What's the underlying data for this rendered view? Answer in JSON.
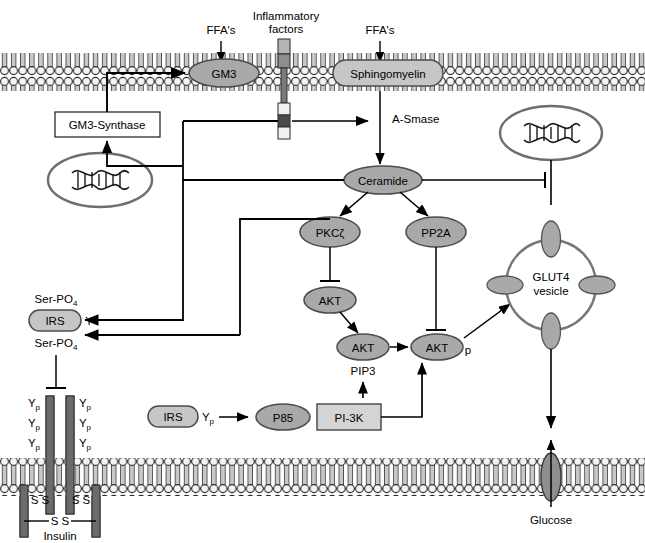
{
  "diagram": {
    "colors": {
      "node_fill": "#a9a9a9",
      "node_stroke": "#4d4d4d",
      "box_fill": "#ffffff",
      "pi3k_fill": "#d4d4d4",
      "membrane_tail": "#c8c8c8",
      "membrane_head": "#f2f2f2",
      "membrane_outline": "#333333",
      "receptor_dark": "#5a5a5a",
      "receptor_light": "#b5b5b5",
      "line": "#000000",
      "nucleus_stroke": "#666666"
    }
  },
  "stimuli": {
    "ffa_left": "FFA's",
    "inflammatory": {
      "line1": "Inflammatory",
      "line2": "factors"
    },
    "ffa_right": "FFA's"
  },
  "membrane_top": {
    "gm3": "GM3",
    "sphingomyelin": "Sphingomyelin"
  },
  "enzymes": {
    "gm3_synthase": "GM3-Synthase",
    "a_smase": "A-Smase",
    "ceramide": "Ceramide",
    "pkc_zeta": "PKCζ",
    "pp2a": "PP2A"
  },
  "akt_cascade": {
    "akt_inhibited": "AKT",
    "akt_pip3": "AKT",
    "pip3_label": "PIP3",
    "akt_phospho": "AKT",
    "phospho_mark": "p"
  },
  "irs_upper": {
    "ser_po4_top": "Ser-PO",
    "ser_po4_top_sub": "4",
    "name": "IRS",
    "tyr": "Y",
    "ser_po4_bottom": "Ser-PO",
    "ser_po4_bottom_sub": "4"
  },
  "irs_lower": {
    "name": "IRS",
    "tyr": "Y",
    "tyr_sub": "p",
    "p85": "P85",
    "pi3k": "PI-3K"
  },
  "insulin_receptor": {
    "tyr_labels": [
      "Y",
      "Y",
      "Y",
      "Y",
      "Y",
      "Y"
    ],
    "tyr_sub": "p",
    "disulfide_left_upper": "S S",
    "disulfide_right_upper": "S S",
    "disulfide_lower": "S S",
    "insulin_label": "Insulin"
  },
  "glut4": {
    "line1": "GLUT4",
    "line2": "vesicle"
  },
  "transport": {
    "glucose": "Glucose"
  }
}
